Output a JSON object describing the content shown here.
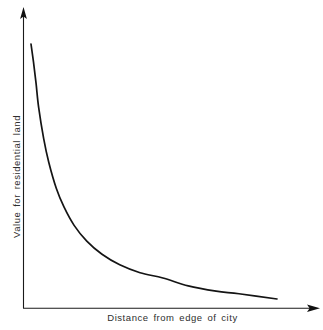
{
  "chart": {
    "title": "",
    "background_color": "#ffffff",
    "axis_color": "#1a1a1a",
    "curve_color": "#141414",
    "text_color": "#2e2e2e",
    "xlabel": "Distance from edge of city",
    "ylabel": "Value for residential land"
  },
  "chart_data": {
    "type": "line",
    "title": "",
    "subtitle": "",
    "xlabel": "Distance from edge of city",
    "ylabel": "Value for residential land",
    "xlim": [
      0,
      1
    ],
    "ylim": [
      0,
      1
    ],
    "grid": false,
    "legend": false,
    "legend_position": "none",
    "x_tick_labels": [],
    "y_tick_labels": [],
    "annotations": [],
    "series": [
      {
        "name": "Value for residential land",
        "color": "#141414",
        "x": [
          0.03,
          0.04,
          0.05,
          0.06,
          0.08,
          0.1,
          0.13,
          0.16,
          0.2,
          0.25,
          0.31,
          0.38,
          0.46,
          0.55,
          0.65,
          0.76,
          0.85,
          1.0
        ],
        "y": [
          1.0,
          0.93,
          0.85,
          0.76,
          0.64,
          0.55,
          0.45,
          0.38,
          0.31,
          0.25,
          0.2,
          0.16,
          0.13,
          0.11,
          0.08,
          0.06,
          0.05,
          0.03
        ]
      }
    ]
  },
  "geometry": {
    "y_axis": {
      "x": 23,
      "y_top": 10,
      "y_bottom": 308
    },
    "x_axis": {
      "y": 308,
      "x_left": 23,
      "x_right": 318
    },
    "curve_path": "M 31.2 44 C 32.6 86, 34.6 124, 38.4 156 C 42.6 191, 48.6 218, 57.6 240 C 68 265, 83 281, 104 291 C 127 301, 160 305, 200 306.6 C 226 297.6, 252 298.4, 277 299.2",
    "curve_start": [
      31,
      44
    ],
    "curve_end": [
      277,
      299
    ]
  }
}
